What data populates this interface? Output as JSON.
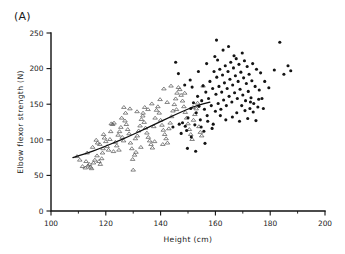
{
  "figure": {
    "panel_label": "(A)"
  },
  "chart_data": {
    "type": "scatter",
    "title": "",
    "xlabel": "Height (cm)",
    "ylabel": "Elbow flexor strength (N)",
    "xlim": [
      100,
      200
    ],
    "ylim": [
      0,
      250
    ],
    "xticks": [
      100,
      120,
      140,
      160,
      180,
      200
    ],
    "xtick_labels": [
      "100",
      "120",
      "140",
      "160",
      "180",
      "200"
    ],
    "xticks_minor": [
      110,
      130,
      150,
      170,
      190
    ],
    "yticks": [
      0,
      50,
      100,
      150,
      200,
      250
    ],
    "ytick_labels": [
      "0",
      "50",
      "100",
      "150",
      "200",
      "250"
    ],
    "grid": false,
    "legend": false,
    "axes_spines": [
      "left",
      "bottom"
    ],
    "series": [
      {
        "name": "children",
        "marker": "open-triangle",
        "marker_color": "#555555",
        "points": [
          [
            109.5,
            77
          ],
          [
            110.5,
            72
          ],
          [
            111.5,
            63
          ],
          [
            112.5,
            61
          ],
          [
            113.5,
            64
          ],
          [
            114.0,
            66
          ],
          [
            114.8,
            60
          ],
          [
            115.5,
            68
          ],
          [
            116.0,
            72
          ],
          [
            116.5,
            100
          ],
          [
            117.0,
            96
          ],
          [
            117.5,
            70
          ],
          [
            118.0,
            66
          ],
          [
            118.5,
            74
          ],
          [
            119.0,
            88
          ],
          [
            119.5,
            103
          ],
          [
            120.0,
            98
          ],
          [
            120.5,
            91
          ],
          [
            121.0,
            86
          ],
          [
            121.5,
            101
          ],
          [
            122.0,
            123
          ],
          [
            122.5,
            122
          ],
          [
            123.0,
            124
          ],
          [
            123.5,
            97
          ],
          [
            124.0,
            92
          ],
          [
            124.5,
            107
          ],
          [
            125.0,
            112
          ],
          [
            125.5,
            118
          ],
          [
            126.0,
            104
          ],
          [
            126.5,
            99
          ],
          [
            127.0,
            127
          ],
          [
            127.5,
            122
          ],
          [
            128.0,
            115
          ],
          [
            128.5,
            109
          ],
          [
            129.0,
            96
          ],
          [
            129.5,
            88
          ],
          [
            130.0,
            58
          ],
          [
            130.5,
            79
          ],
          [
            131.0,
            83
          ],
          [
            131.5,
            106
          ],
          [
            132.0,
            113
          ],
          [
            132.5,
            120
          ],
          [
            133.0,
            129
          ],
          [
            133.5,
            134
          ],
          [
            134.0,
            125
          ],
          [
            134.5,
            117
          ],
          [
            135.0,
            110
          ],
          [
            135.5,
            104
          ],
          [
            136.0,
            99
          ],
          [
            136.5,
            94
          ],
          [
            137.0,
            89
          ],
          [
            137.5,
            119
          ],
          [
            138.0,
            131
          ],
          [
            138.5,
            142
          ],
          [
            139.0,
            147
          ],
          [
            139.5,
            138
          ],
          [
            140.0,
            128
          ],
          [
            140.5,
            121
          ],
          [
            141.0,
            114
          ],
          [
            141.5,
            108
          ],
          [
            142.0,
            102
          ],
          [
            142.5,
            96
          ],
          [
            143.0,
            116
          ],
          [
            143.5,
            124
          ],
          [
            144.0,
            133
          ],
          [
            144.5,
            141
          ],
          [
            145.0,
            150
          ],
          [
            145.5,
            158
          ],
          [
            146.0,
            166
          ],
          [
            146.5,
            174
          ],
          [
            147.0,
            171
          ],
          [
            147.5,
            163
          ],
          [
            148.0,
            155
          ],
          [
            148.5,
            147
          ],
          [
            149.0,
            139
          ],
          [
            149.5,
            131
          ],
          [
            150.0,
            123
          ],
          [
            150.5,
            115
          ],
          [
            151.0,
            108
          ],
          [
            151.5,
            101
          ],
          [
            152.0,
            128
          ],
          [
            152.5,
            136
          ],
          [
            153.0,
            144
          ],
          [
            153.5,
            152
          ],
          [
            154.0,
            119
          ],
          [
            154.5,
            111
          ],
          [
            155.0,
            106
          ],
          [
            155.5,
            176
          ],
          [
            143.8,
            176
          ],
          [
            141.2,
            172
          ],
          [
            136.8,
            151
          ],
          [
            134.2,
            146
          ],
          [
            130.8,
            102
          ],
          [
            127.2,
            138
          ],
          [
            125.8,
            131
          ],
          [
            121.8,
            112
          ],
          [
            119.2,
            108
          ],
          [
            117.8,
            94
          ],
          [
            115.2,
            90
          ],
          [
            113.2,
            82
          ],
          [
            126.6,
            146
          ],
          [
            128.8,
            144
          ],
          [
            131.4,
            140
          ],
          [
            133.6,
            138
          ],
          [
            135.4,
            143
          ],
          [
            139.8,
            157
          ],
          [
            142.4,
            153
          ],
          [
            145.8,
            143
          ],
          [
            148.8,
            166
          ],
          [
            151.8,
            146
          ],
          [
            112.8,
            70
          ],
          [
            114.4,
            62
          ],
          [
            116.8,
            78
          ],
          [
            118.8,
            82
          ],
          [
            122.8,
            84
          ],
          [
            124.8,
            86
          ],
          [
            129.8,
            73
          ],
          [
            132.8,
            90
          ],
          [
            137.8,
            98
          ],
          [
            140.8,
            94
          ]
        ]
      },
      {
        "name": "adults",
        "marker": "filled-circle",
        "marker_color": "#141414",
        "points": [
          [
            145.5,
            209
          ],
          [
            146.5,
            193
          ],
          [
            148.0,
            124
          ],
          [
            149.0,
            119
          ],
          [
            150.0,
            131
          ],
          [
            151.0,
            144
          ],
          [
            151.5,
            174
          ],
          [
            152.0,
            152
          ],
          [
            152.5,
            121
          ],
          [
            153.0,
            138
          ],
          [
            153.5,
            161
          ],
          [
            154.0,
            147
          ],
          [
            154.5,
            128
          ],
          [
            155.0,
            155
          ],
          [
            155.5,
            176
          ],
          [
            156.0,
            143
          ],
          [
            156.5,
            167
          ],
          [
            157.0,
            134
          ],
          [
            157.5,
            158
          ],
          [
            158.0,
            182
          ],
          [
            158.5,
            148
          ],
          [
            159.0,
            172
          ],
          [
            159.5,
            196
          ],
          [
            160.0,
            140
          ],
          [
            160.2,
            164
          ],
          [
            160.5,
            188
          ],
          [
            160.8,
            212
          ],
          [
            161.0,
            151
          ],
          [
            161.3,
            175
          ],
          [
            161.6,
            199
          ],
          [
            162.0,
            143
          ],
          [
            162.3,
            167
          ],
          [
            162.6,
            191
          ],
          [
            163.0,
            156
          ],
          [
            163.3,
            180
          ],
          [
            163.6,
            204
          ],
          [
            164.0,
            148
          ],
          [
            164.3,
            172
          ],
          [
            164.6,
            196
          ],
          [
            165.0,
            161
          ],
          [
            165.3,
            185
          ],
          [
            165.6,
            209
          ],
          [
            166.0,
            153
          ],
          [
            166.3,
            177
          ],
          [
            166.6,
            201
          ],
          [
            167.0,
            166
          ],
          [
            167.3,
            190
          ],
          [
            167.6,
            214
          ],
          [
            168.0,
            158
          ],
          [
            168.3,
            182
          ],
          [
            168.6,
            206
          ],
          [
            169.0,
            171
          ],
          [
            169.3,
            195
          ],
          [
            169.6,
            148
          ],
          [
            170.0,
            163
          ],
          [
            170.3,
            187
          ],
          [
            170.6,
            211
          ],
          [
            171.0,
            155
          ],
          [
            171.3,
            179
          ],
          [
            171.6,
            203
          ],
          [
            172.0,
            168
          ],
          [
            172.3,
            192
          ],
          [
            172.6,
            144
          ],
          [
            173.0,
            159
          ],
          [
            173.3,
            183
          ],
          [
            173.6,
            207
          ],
          [
            174.0,
            151
          ],
          [
            174.5,
            175
          ],
          [
            175.0,
            199
          ],
          [
            175.5,
            146
          ],
          [
            176.0,
            170
          ],
          [
            176.5,
            194
          ],
          [
            177.0,
            158
          ],
          [
            178.0,
            182
          ],
          [
            179.5,
            173
          ],
          [
            181.5,
            198
          ],
          [
            183.5,
            237
          ],
          [
            185.0,
            192
          ],
          [
            186.5,
            204
          ],
          [
            187.5,
            197
          ],
          [
            147.5,
            109
          ],
          [
            149.5,
            113
          ],
          [
            155.8,
            112
          ],
          [
            158.8,
            116
          ],
          [
            151.2,
            104
          ],
          [
            160.4,
            240
          ],
          [
            162.8,
            226
          ],
          [
            164.8,
            231
          ],
          [
            166.8,
            218
          ],
          [
            169.8,
            222
          ],
          [
            153.8,
            196
          ],
          [
            156.8,
            207
          ],
          [
            150.8,
            184
          ],
          [
            148.8,
            177
          ],
          [
            159.8,
            217
          ],
          [
            144.5,
            118
          ],
          [
            146.8,
            122
          ],
          [
            152.8,
            84
          ],
          [
            156.2,
            95
          ],
          [
            149.8,
            88
          ],
          [
            163.8,
            128
          ],
          [
            166.2,
            132
          ],
          [
            168.8,
            126
          ],
          [
            171.8,
            130
          ],
          [
            174.8,
            127
          ],
          [
            161.8,
            134
          ],
          [
            159.2,
            122
          ],
          [
            157.2,
            126
          ],
          [
            154.8,
            118
          ],
          [
            172.8,
            153
          ],
          [
            175.8,
            157
          ],
          [
            177.5,
            144
          ],
          [
            173.8,
            139
          ],
          [
            170.8,
            141
          ],
          [
            167.8,
            138
          ]
        ]
      }
    ],
    "trend_line": {
      "name": "fitted-curve",
      "color": "#0d0d0d",
      "points": [
        [
          108.0,
          75
        ],
        [
          113.0,
          81
        ],
        [
          118.0,
          88
        ],
        [
          123.0,
          96
        ],
        [
          128.0,
          104
        ],
        [
          133.0,
          113
        ],
        [
          138.0,
          122
        ],
        [
          143.0,
          131
        ],
        [
          148.0,
          140
        ],
        [
          153.0,
          148
        ],
        [
          158.0,
          153
        ]
      ]
    }
  }
}
